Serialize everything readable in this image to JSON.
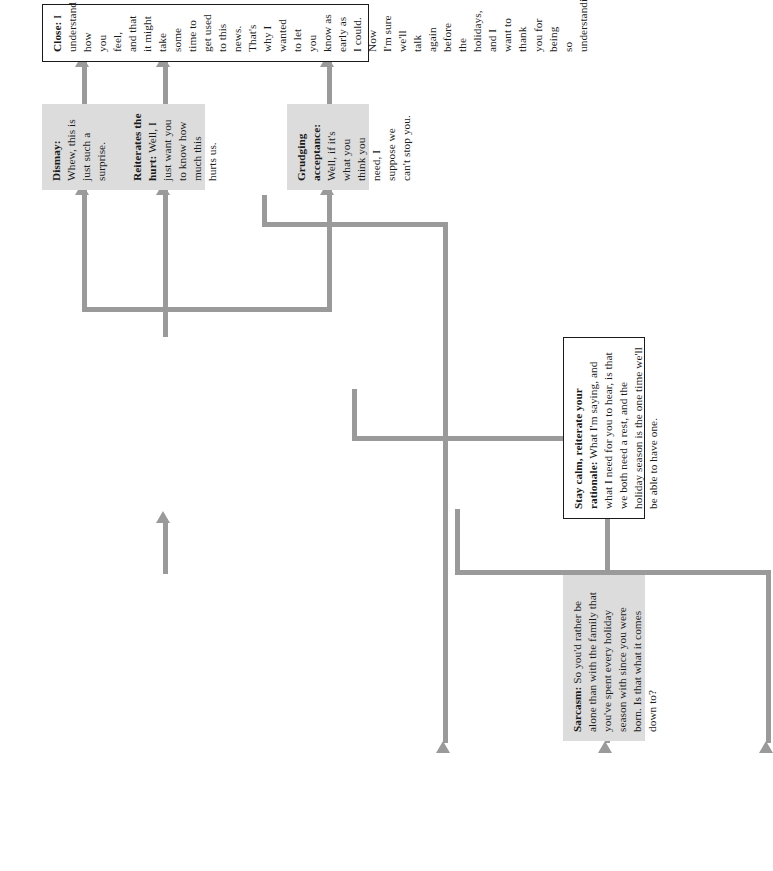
{
  "diagram": {
    "orientation": "rotated-90",
    "accent_color": "#9a9a9a",
    "shaded_fill": "#dcdcdc",
    "outline_color": "#1a1a1a"
  },
  "nodes": {
    "sarcasm": {
      "label": "Sarcasm:",
      "body": " So you'd rather be alone than with the family that you've spent every holiday season with since you were born. Is that what it comes down to?",
      "style": "shaded"
    },
    "stay_calm": {
      "label": "Stay calm, reiterate your rationale:",
      "body": " What I'm saying, and what I need for you to hear, is that we both need a rest, and the holiday season is the one time we'll be able to have one.",
      "style": "outlined"
    },
    "grudging_acceptance": {
      "label": "Grudging acceptance:",
      "body": " Well, if it's what you think you need, I suppose we can't stop you.",
      "style": "shaded"
    },
    "reiterates_hurt": {
      "label": "Reiterates the hurt:",
      "body": " Well, I just want you to know how much this hurts us.",
      "style": "shaded"
    },
    "dismay": {
      "label": "Dismay:",
      "body": " Whew, this is just such a surprise.",
      "style": "shaded"
    },
    "close": {
      "label": "Close:",
      "body": " I understand how you feel, and that it might take some time to get used to this news. That's why I wanted to let you know as early as I could. Now I'm sure we'll talk again before the holidays, and I want to thank you for being so understanding.",
      "style": "outlined"
    }
  },
  "connectors": [
    {
      "from": "grudging_acceptance",
      "to": "sarcasm",
      "name": "grudging-to-sarcasm"
    },
    {
      "from": "reiterates_hurt",
      "to": "sarcasm",
      "name": "hurt-to-sarcasm"
    },
    {
      "from": "dismay",
      "to": "sarcasm",
      "name": "dismay-to-sarcasm"
    },
    {
      "from": "sarcasm",
      "to": "stay_calm",
      "name": "sarcasm-to-stay-calm"
    },
    {
      "from": "stay_calm",
      "to": "grudging_acceptance",
      "name": "stay-calm-to-grudging"
    },
    {
      "from": "stay_calm",
      "to": "reiterates_hurt",
      "name": "stay-calm-to-hurt"
    },
    {
      "from": "stay_calm",
      "to": "dismay",
      "name": "stay-calm-to-dismay"
    },
    {
      "from": "grudging_acceptance",
      "to": "close",
      "name": "grudging-to-close"
    },
    {
      "from": "reiterates_hurt",
      "to": "close",
      "name": "hurt-to-close"
    },
    {
      "from": "dismay",
      "to": "close",
      "name": "dismay-to-close"
    }
  ]
}
